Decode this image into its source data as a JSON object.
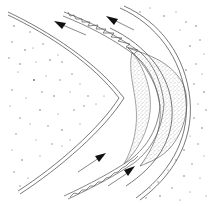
{
  "diagram": {
    "type": "schematic",
    "colors": {
      "background": "#ffffff",
      "line": "#555555",
      "arrow": "#111111",
      "stipple": "#8a8a8a",
      "speckle": "#777777"
    },
    "arrows": [
      {
        "id": "arrow-top-left",
        "direction": "up-left"
      },
      {
        "id": "arrow-top-right",
        "direction": "up-left"
      },
      {
        "id": "arrow-bottom-left",
        "direction": "up-right"
      },
      {
        "id": "arrow-bottom-right",
        "direction": "up-right"
      }
    ],
    "regions": [
      {
        "id": "speckled-left-region",
        "fill": "speckled"
      },
      {
        "id": "speckled-right-region",
        "fill": "speckled"
      },
      {
        "id": "stippled-crescent",
        "fill": "stippled"
      },
      {
        "id": "hatched-band-top",
        "fill": "ladder-hatch"
      },
      {
        "id": "hatched-band-bottom",
        "fill": "ladder-hatch"
      }
    ]
  }
}
